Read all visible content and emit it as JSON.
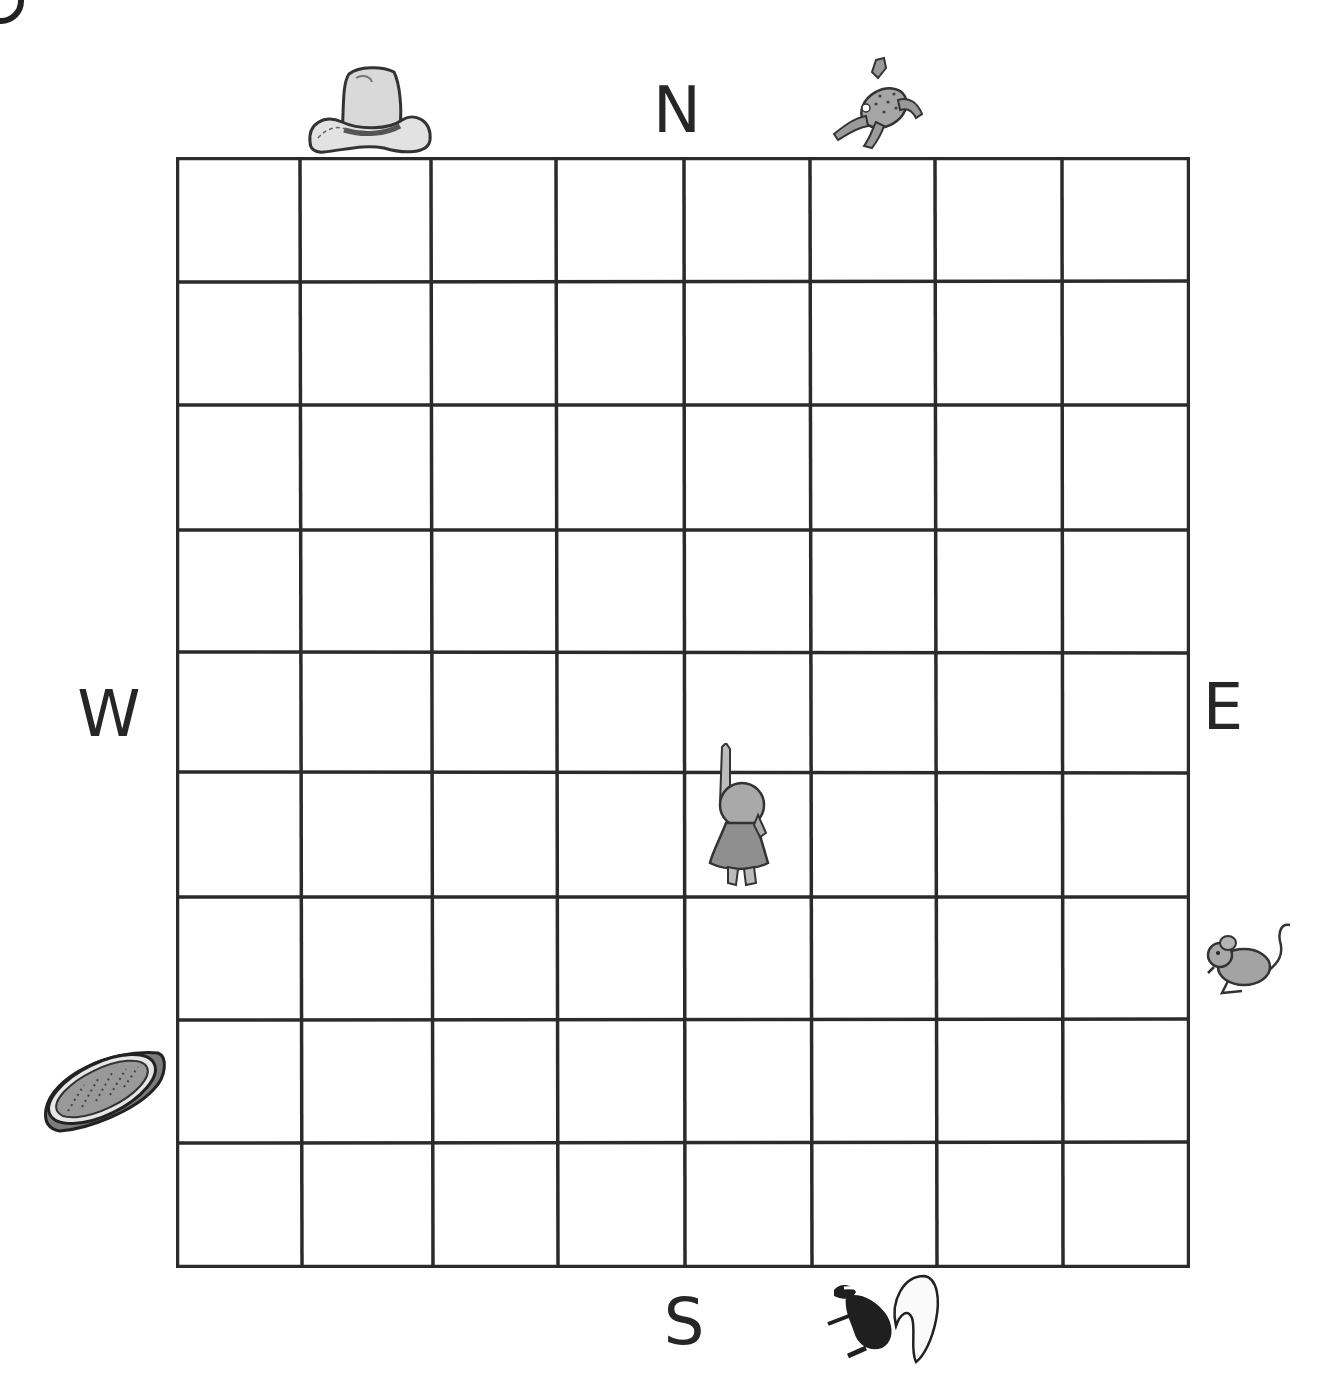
{
  "diagram": {
    "type": "coordinate-grid-map",
    "grid": {
      "columns": 8,
      "rows": 9
    },
    "compass": {
      "north": "N",
      "south": "S",
      "east": "E",
      "west": "W"
    },
    "objects": [
      {
        "name": "cowboy hat",
        "position": "top edge, above column 2"
      },
      {
        "name": "frog",
        "position": "top edge, right of N, above column 6"
      },
      {
        "name": "mouse",
        "position": "right edge, beside row 7"
      },
      {
        "name": "basket",
        "position": "left edge, beside row 8"
      },
      {
        "name": "skunk",
        "position": "bottom edge, right of S, below column 6"
      },
      {
        "name": "girl pointing north",
        "position": "row 6, column 5 (center of grid)"
      }
    ],
    "colors": {
      "line": "#2b2b2b",
      "background": "#ffffff",
      "illustration_fill": "#a8a8a8"
    }
  }
}
